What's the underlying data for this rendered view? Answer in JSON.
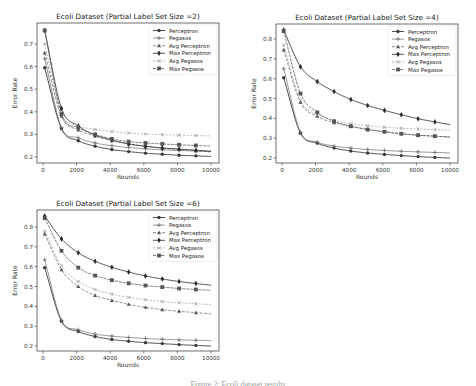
{
  "caption": "Figure 2: Ecoli dataset results",
  "chart_data": [
    {
      "type": "line",
      "title": "Ecoli Dataset (Partial Label Set Size =2)",
      "xlabel": "Rounds",
      "ylabel": "Error Rate",
      "xlim": [
        -300,
        10300
      ],
      "ylim": [
        0.18,
        0.78
      ],
      "xticks": [
        0,
        2000,
        4000,
        6000,
        8000,
        10000
      ],
      "yticks": [
        0.2,
        0.3,
        0.4,
        0.5,
        0.6,
        0.7
      ],
      "legend_position": "upper right",
      "grid": false,
      "x": [
        100,
        1100,
        2100,
        3100,
        4100,
        5100,
        6100,
        7100,
        8100,
        9100
      ],
      "series": [
        {
          "name": "Perceptron",
          "marker": "circle",
          "values": [
            0.595,
            0.325,
            0.272,
            0.248,
            0.233,
            0.224,
            0.217,
            0.212,
            0.208,
            0.205
          ]
        },
        {
          "name": "Pegasos",
          "marker": "plus",
          "values": [
            0.635,
            0.33,
            0.285,
            0.262,
            0.25,
            0.242,
            0.236,
            0.232,
            0.229,
            0.226
          ]
        },
        {
          "name": "Avg Perceptron",
          "marker": "triangle",
          "values": [
            0.66,
            0.38,
            0.32,
            0.293,
            0.272,
            0.258,
            0.248,
            0.24,
            0.233,
            0.228
          ]
        },
        {
          "name": "Max Perceptron",
          "marker": "diamond",
          "values": [
            0.76,
            0.415,
            0.338,
            0.297,
            0.275,
            0.258,
            0.247,
            0.24,
            0.235,
            0.23
          ]
        },
        {
          "name": "Avg Pegasos",
          "marker": "x",
          "values": [
            0.7,
            0.39,
            0.34,
            0.322,
            0.313,
            0.306,
            0.302,
            0.299,
            0.297,
            0.295
          ]
        },
        {
          "name": "Max Pegasos",
          "marker": "square",
          "values": [
            0.76,
            0.39,
            0.33,
            0.3,
            0.28,
            0.268,
            0.262,
            0.258,
            0.254,
            0.251
          ]
        }
      ]
    },
    {
      "type": "line",
      "title": "Ecoli Dataset (Partial Label Set Size =4)",
      "xlabel": "Rounds",
      "ylabel": "Error Rate",
      "xlim": [
        -300,
        10300
      ],
      "ylim": [
        0.17,
        0.87
      ],
      "xticks": [
        0,
        2000,
        4000,
        6000,
        8000,
        10000
      ],
      "yticks": [
        0.2,
        0.3,
        0.4,
        0.5,
        0.6,
        0.7,
        0.8
      ],
      "legend_position": "upper right",
      "grid": false,
      "x": [
        100,
        1100,
        2100,
        3100,
        4100,
        5100,
        6100,
        7100,
        8100,
        9100
      ],
      "series": [
        {
          "name": "Perceptron",
          "marker": "circle",
          "values": [
            0.605,
            0.325,
            0.275,
            0.25,
            0.235,
            0.225,
            0.218,
            0.212,
            0.207,
            0.203
          ]
        },
        {
          "name": "Pegasos",
          "marker": "plus",
          "values": [
            0.65,
            0.33,
            0.28,
            0.26,
            0.25,
            0.243,
            0.238,
            0.234,
            0.231,
            0.228
          ]
        },
        {
          "name": "Avg Perceptron",
          "marker": "triangle",
          "values": [
            0.745,
            0.48,
            0.41,
            0.378,
            0.36,
            0.345,
            0.333,
            0.323,
            0.315,
            0.31
          ]
        },
        {
          "name": "Max Perceptron",
          "marker": "diamond",
          "values": [
            0.845,
            0.66,
            0.585,
            0.535,
            0.495,
            0.465,
            0.44,
            0.418,
            0.398,
            0.382
          ]
        },
        {
          "name": "Avg Pegasos",
          "marker": "x",
          "values": [
            0.77,
            0.49,
            0.42,
            0.39,
            0.372,
            0.362,
            0.355,
            0.35,
            0.346,
            0.343
          ]
        },
        {
          "name": "Max Pegasos",
          "marker": "square",
          "values": [
            0.84,
            0.525,
            0.43,
            0.385,
            0.36,
            0.343,
            0.332,
            0.322,
            0.315,
            0.31
          ]
        }
      ]
    },
    {
      "type": "line",
      "title": "Ecoli Dataset (Partial Label Set Size =6)",
      "xlabel": "Rounds",
      "ylabel": "Error Rate",
      "xlim": [
        -300,
        10300
      ],
      "ylim": [
        0.17,
        0.87
      ],
      "xticks": [
        0,
        2000,
        4000,
        6000,
        8000,
        10000
      ],
      "yticks": [
        0.2,
        0.3,
        0.4,
        0.5,
        0.6,
        0.7,
        0.8
      ],
      "legend_position": "upper right",
      "grid": false,
      "x": [
        100,
        1100,
        2100,
        3100,
        4100,
        5100,
        6100,
        7100,
        8100,
        9100
      ],
      "series": [
        {
          "name": "Perceptron",
          "marker": "circle",
          "values": [
            0.595,
            0.325,
            0.273,
            0.248,
            0.233,
            0.224,
            0.217,
            0.212,
            0.207,
            0.203
          ]
        },
        {
          "name": "Pegasos",
          "marker": "plus",
          "values": [
            0.635,
            0.33,
            0.282,
            0.26,
            0.25,
            0.243,
            0.238,
            0.234,
            0.231,
            0.229
          ]
        },
        {
          "name": "Avg Perceptron",
          "marker": "triangle",
          "values": [
            0.765,
            0.585,
            0.5,
            0.455,
            0.43,
            0.41,
            0.395,
            0.383,
            0.375,
            0.368
          ]
        },
        {
          "name": "Max Perceptron",
          "marker": "diamond",
          "values": [
            0.855,
            0.74,
            0.67,
            0.627,
            0.597,
            0.573,
            0.553,
            0.538,
            0.525,
            0.515
          ]
        },
        {
          "name": "Avg Pegasos",
          "marker": "x",
          "values": [
            0.78,
            0.605,
            0.525,
            0.485,
            0.462,
            0.445,
            0.433,
            0.424,
            0.418,
            0.413
          ]
        },
        {
          "name": "Max Pegasos",
          "marker": "square",
          "values": [
            0.845,
            0.68,
            0.595,
            0.555,
            0.532,
            0.516,
            0.505,
            0.497,
            0.49,
            0.485
          ]
        }
      ]
    }
  ],
  "panels": [
    {
      "left": 0,
      "top": 0,
      "width": 238,
      "height": 190,
      "plot": {
        "x0": 37,
        "y0": 23,
        "x1": 219,
        "y1": 163
      },
      "xpix": [
        43,
        211
      ],
      "ypix": {
        "v0": 0.2,
        "p0": 157,
        "v1": 0.7,
        "p1": 44
      }
    },
    {
      "left": 238,
      "top": 0,
      "width": 238,
      "height": 190,
      "plot": {
        "x0": 38,
        "y0": 24,
        "x1": 220,
        "y1": 163
      },
      "xpix": [
        44,
        212
      ],
      "ypix": {
        "v0": 0.2,
        "p0": 158,
        "v1": 0.8,
        "p1": 39
      }
    },
    {
      "left": 0,
      "top": 188,
      "width": 238,
      "height": 190,
      "plot": {
        "x0": 37,
        "y0": 22,
        "x1": 219,
        "y1": 163
      },
      "xpix": [
        43,
        211
      ],
      "ypix": {
        "v0": 0.2,
        "p0": 158,
        "v1": 0.8,
        "p1": 39
      }
    }
  ]
}
